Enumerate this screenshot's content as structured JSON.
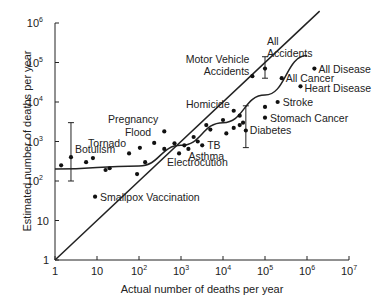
{
  "chart_data": {
    "type": "scatter",
    "title": "",
    "xlabel": "Actual number of deaths per year",
    "ylabel": "Estimated number of deaths per year",
    "xscale": "log",
    "yscale": "log",
    "xlim": [
      1,
      10000000
    ],
    "ylim": [
      1,
      1000000
    ],
    "grid": false,
    "legend": "none",
    "x_ticks": [
      {
        "base": "1",
        "exp": ""
      },
      {
        "base": "10",
        "exp": ""
      },
      {
        "base": "10",
        "exp": "2"
      },
      {
        "base": "10",
        "exp": "3"
      },
      {
        "base": "10",
        "exp": "4"
      },
      {
        "base": "10",
        "exp": "5"
      },
      {
        "base": "10",
        "exp": "6"
      },
      {
        "base": "10",
        "exp": "7"
      }
    ],
    "y_ticks": [
      {
        "base": "1",
        "exp": ""
      },
      {
        "base": "10",
        "exp": ""
      },
      {
        "base": "10",
        "exp": "2"
      },
      {
        "base": "10",
        "exp": "3"
      },
      {
        "base": "10",
        "exp": "4"
      },
      {
        "base": "10",
        "exp": "5"
      },
      {
        "base": "10",
        "exp": "6"
      }
    ],
    "points": [
      {
        "x": 1.4,
        "y": 250,
        "label": ""
      },
      {
        "x": 2.4,
        "y": 400,
        "label": "Botulism",
        "err": [
          100,
          3000
        ]
      },
      {
        "x": 5.5,
        "y": 300,
        "label": ""
      },
      {
        "x": 8,
        "y": 380,
        "label": ""
      },
      {
        "x": 9,
        "y": 40,
        "label": "Smallpox Vaccination"
      },
      {
        "x": 16,
        "y": 190,
        "label": ""
      },
      {
        "x": 20,
        "y": 210,
        "label": ""
      },
      {
        "x": 58,
        "y": 500,
        "label": "Tornado"
      },
      {
        "x": 105,
        "y": 690,
        "label": ""
      },
      {
        "x": 90,
        "y": 150,
        "label": ""
      },
      {
        "x": 140,
        "y": 300,
        "label": ""
      },
      {
        "x": 230,
        "y": 920,
        "label": "Flood"
      },
      {
        "x": 400,
        "y": 1800,
        "label": "Pregnancy"
      },
      {
        "x": 400,
        "y": 650,
        "label": ""
      },
      {
        "x": 700,
        "y": 900,
        "label": ""
      },
      {
        "x": 900,
        "y": 500,
        "label": "Electrocution"
      },
      {
        "x": 1200,
        "y": 800,
        "label": ""
      },
      {
        "x": 1500,
        "y": 650,
        "label": "Asthma"
      },
      {
        "x": 2000,
        "y": 1300,
        "label": ""
      },
      {
        "x": 2500,
        "y": 1000,
        "label": ""
      },
      {
        "x": 3200,
        "y": 800,
        "label": "TB"
      },
      {
        "x": 4000,
        "y": 2600,
        "label": ""
      },
      {
        "x": 5000,
        "y": 2000,
        "label": ""
      },
      {
        "x": 10000,
        "y": 3500,
        "label": ""
      },
      {
        "x": 12000,
        "y": 1600,
        "label": ""
      },
      {
        "x": 18000,
        "y": 6000,
        "label": "Homicide"
      },
      {
        "x": 18000,
        "y": 2200,
        "label": ""
      },
      {
        "x": 25000,
        "y": 4500,
        "label": ""
      },
      {
        "x": 25000,
        "y": 2600,
        "label": ""
      },
      {
        "x": 30000,
        "y": 3000,
        "label": ""
      },
      {
        "x": 35000,
        "y": 1900,
        "label": "Diabetes",
        "err": [
          700,
          8000
        ]
      },
      {
        "x": 50000,
        "y": 45000,
        "label": "Motor Vehicle Accidents"
      },
      {
        "x": 100000,
        "y": 70000,
        "label": "All Accidents",
        "err": [
          40000,
          140000
        ]
      },
      {
        "x": 100000,
        "y": 7500,
        "label": ""
      },
      {
        "x": 100000,
        "y": 4000,
        "label": "Stomach Cancer"
      },
      {
        "x": 200000,
        "y": 10000,
        "label": "Stroke"
      },
      {
        "x": 250000,
        "y": 40000,
        "label": "All Cancer"
      },
      {
        "x": 700000,
        "y": 25000,
        "label": "Heart Disease"
      },
      {
        "x": 1500000,
        "y": 70000,
        "label": "All Disease"
      }
    ],
    "lines": [
      {
        "name": "identity",
        "type": "straight",
        "from": [
          1,
          1
        ],
        "to": [
          2000000,
          2000000
        ]
      },
      {
        "name": "best-fit curve",
        "type": "quadratic",
        "through": [
          [
            1,
            200
          ],
          [
            100,
            240
          ],
          [
            1000,
            800
          ],
          [
            10000,
            3000
          ],
          [
            100000,
            15000
          ],
          [
            1000000,
            150000
          ]
        ]
      }
    ]
  }
}
